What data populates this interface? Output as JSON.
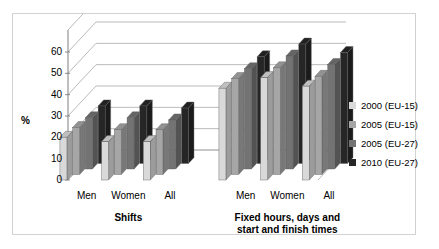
{
  "chart_data": {
    "type": "bar",
    "title": "",
    "subtitle": "",
    "xlabel": "",
    "ylabel": "%",
    "ylim": [
      0,
      60
    ],
    "yticks": [
      0,
      10,
      20,
      30,
      40,
      50,
      60
    ],
    "grid": true,
    "three_d": true,
    "legend_position": "right",
    "group_labels": [
      "Shifts",
      "Fixed hours, days and start and finish times"
    ],
    "categories": [
      "Men (Shifts)",
      "Women (Shifts)",
      "All (Shifts)",
      "Men (Fixed hours)",
      "Women (Fixed hours)",
      "All (Fixed hours)"
    ],
    "tick_labels": [
      "Men",
      "Women",
      "All",
      "Men",
      "Women",
      "All"
    ],
    "series": [
      {
        "name": "2000 (EU-15)",
        "color": "#d9d9d9",
        "values": [
          20,
          18,
          18,
          43,
          48,
          44
        ]
      },
      {
        "name": "2005 (EU-15)",
        "color": "#a6a6a6",
        "values": [
          22,
          21,
          21,
          45,
          50,
          46
        ]
      },
      {
        "name": "2005 (EU-27)",
        "color": "#737373",
        "values": [
          24,
          24,
          23,
          47,
          53,
          49
        ]
      },
      {
        "name": "2010 (EU-27)",
        "color": "#262626",
        "values": [
          27,
          27,
          26,
          50,
          56,
          52
        ]
      }
    ]
  },
  "axis": {
    "y_title": "%",
    "y_tick_labels": [
      "60",
      "50",
      "40",
      "30",
      "20",
      "10",
      "0"
    ]
  },
  "x_axis": {
    "groups": [
      {
        "label": "Shifts",
        "ticks": [
          "Men",
          "Women",
          "All"
        ]
      },
      {
        "label": "Fixed hours, days and\nstart and finish times",
        "ticks": [
          "Men",
          "Women",
          "All"
        ]
      }
    ],
    "group2_line1": "Fixed hours, days and",
    "group2_line2": "start and finish times"
  },
  "legend": {
    "items": [
      {
        "label": "2000 (EU-15)",
        "color": "#d9d9d9"
      },
      {
        "label": "2005 (EU-15)",
        "color": "#a6a6a6"
      },
      {
        "label": "2005 (EU-27)",
        "color": "#737373"
      },
      {
        "label": "2010 (EU-27)",
        "color": "#262626"
      }
    ]
  }
}
